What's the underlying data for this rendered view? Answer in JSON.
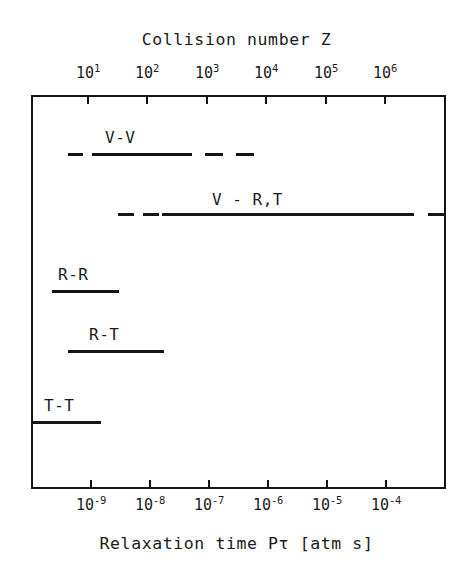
{
  "figure": {
    "top_axis_title": "Collision number Z",
    "bottom_axis_title": "Relaxation time Pτ [atm s]"
  },
  "chart_data": {
    "type": "bar",
    "title": "Collision number Z",
    "xlabel": "Relaxation time Pτ [atm s]",
    "ylabel": "",
    "orientation": "horizontal",
    "scale": "log",
    "grid": false,
    "legend": "none",
    "top_axis": {
      "label": "Collision number Z",
      "ticks": [
        "10^1",
        "10^2",
        "10^3",
        "10^4",
        "10^5",
        "10^6"
      ],
      "tick_mantissas": [
        "10",
        "10",
        "10",
        "10",
        "10",
        "10"
      ],
      "tick_exponents": [
        "1",
        "2",
        "3",
        "4",
        "5",
        "6"
      ],
      "tick_x_px": [
        88,
        147,
        207,
        266,
        326,
        385
      ]
    },
    "bottom_axis": {
      "label": "Relaxation time Pτ [atm s]",
      "ticks": [
        "10^-9",
        "10^-8",
        "10^-7",
        "10^-6",
        "10^-5",
        "10^-4"
      ],
      "tick_mantissas": [
        "10",
        "10",
        "10",
        "10",
        "10",
        "10"
      ],
      "tick_exponents": [
        "-9",
        "-8",
        "-7",
        "-6",
        "-5",
        "-4"
      ],
      "tick_x_px": [
        91,
        150,
        209,
        268,
        327,
        386
      ]
    },
    "categories": [
      "V-V",
      "V - R,T",
      "R-R",
      "R-T",
      "T-T"
    ],
    "series": [
      {
        "name": "V-V",
        "label": "V-V",
        "label_x_px": 105,
        "label_y_px": 128,
        "row_y_px": 153,
        "segments": [
          {
            "x_px": 68,
            "w_px": 15
          },
          {
            "x_px": 92,
            "w_px": 100
          },
          {
            "x_px": 205,
            "w_px": 18
          },
          {
            "x_px": 236,
            "w_px": 18
          }
        ]
      },
      {
        "name": "V - R,T",
        "label": "V - R,T",
        "label_x_px": 212,
        "label_y_px": 190,
        "row_y_px": 213,
        "segments": [
          {
            "x_px": 118,
            "w_px": 16
          },
          {
            "x_px": 143,
            "w_px": 16
          },
          {
            "x_px": 162,
            "w_px": 252
          },
          {
            "x_px": 428,
            "w_px": 16
          }
        ]
      },
      {
        "name": "R-R",
        "label": "R-R",
        "label_x_px": 58,
        "label_y_px": 265,
        "row_y_px": 290,
        "segments": [
          {
            "x_px": 52,
            "w_px": 67
          }
        ]
      },
      {
        "name": "R-T",
        "label": "R-T",
        "label_x_px": 89,
        "label_y_px": 325,
        "row_y_px": 350,
        "segments": [
          {
            "x_px": 68,
            "w_px": 96
          }
        ]
      },
      {
        "name": "T-T",
        "label": "T-T",
        "label_x_px": 44,
        "label_y_px": 396,
        "row_y_px": 421,
        "segments": [
          {
            "x_px": 31,
            "w_px": 70
          }
        ]
      }
    ]
  }
}
